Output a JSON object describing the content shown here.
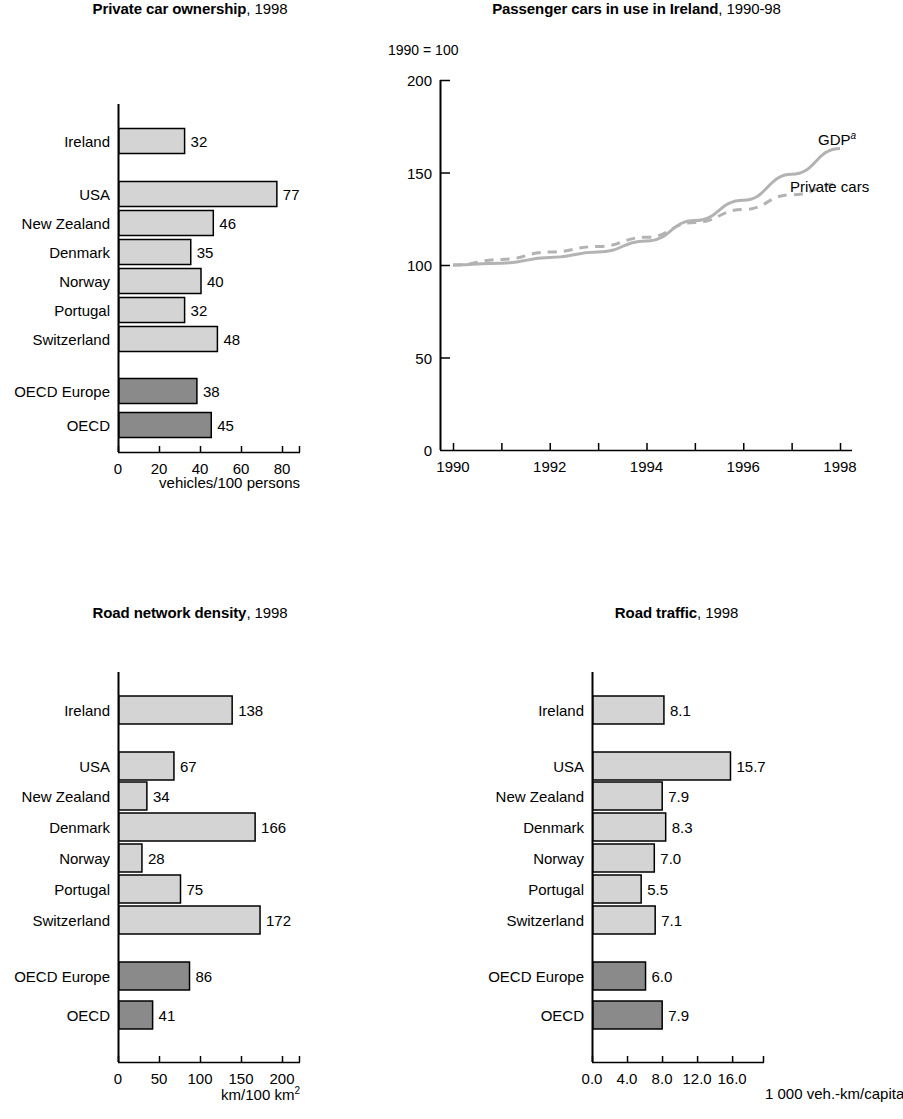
{
  "page": {
    "background": "#ffffff",
    "bar_fill_light": "#d4d4d4",
    "bar_fill_dark": "#8a8a8a",
    "line_color": "#b3b3b3",
    "axis_color": "#000000"
  },
  "charts": [
    {
      "id": "private-car-ownership",
      "title_main": "Private car ownership",
      "title_year": ", 1998",
      "axis_unit": "vehicles/100 persons",
      "categories": [
        "Ireland",
        "USA",
        "New Zealand",
        "Denmark",
        "Norway",
        "Portugal",
        "Switzerland",
        "OECD Europe",
        "OECD"
      ],
      "values": [
        32,
        77,
        46,
        35,
        40,
        32,
        48,
        38,
        45
      ],
      "value_labels": [
        "32",
        "77",
        "46",
        "35",
        "40",
        "32",
        "48",
        "38",
        "45"
      ],
      "highlight": [
        false,
        false,
        false,
        false,
        false,
        false,
        false,
        true,
        true
      ],
      "ticks": [
        0,
        20,
        40,
        60,
        80
      ],
      "tick_labels": [
        "0",
        "20",
        "40",
        "60",
        "80"
      ],
      "xmax": 80
    },
    {
      "id": "road-network-density",
      "title_main": "Road network density",
      "title_year": ", 1998",
      "axis_unit": "km/100 km",
      "axis_unit_sup": "2",
      "categories": [
        "Ireland",
        "USA",
        "New Zealand",
        "Denmark",
        "Norway",
        "Portugal",
        "Switzerland",
        "OECD Europe",
        "OECD"
      ],
      "values": [
        138,
        67,
        34,
        166,
        28,
        75,
        172,
        86,
        41
      ],
      "value_labels": [
        "138",
        "67",
        "34",
        "166",
        "28",
        "75",
        "172",
        "86",
        "41"
      ],
      "highlight": [
        false,
        false,
        false,
        false,
        false,
        false,
        false,
        true,
        true
      ],
      "ticks": [
        0,
        50,
        100,
        150,
        200
      ],
      "tick_labels": [
        "0",
        "50",
        "100",
        "150",
        "200"
      ],
      "xmax": 200
    },
    {
      "id": "road-traffic",
      "title_main": "Road traffic",
      "title_year": ", 1998",
      "axis_unit": "1 000 veh.-km/capita",
      "categories": [
        "Ireland",
        "USA",
        "New Zealand",
        "Denmark",
        "Norway",
        "Portugal",
        "Switzerland",
        "OECD Europe",
        "OECD"
      ],
      "values": [
        8.1,
        15.7,
        7.9,
        8.3,
        7.0,
        5.5,
        7.1,
        6.0,
        7.9
      ],
      "value_labels": [
        "8.1",
        "15.7",
        "7.9",
        "8.3",
        "7.0",
        "5.5",
        "7.1",
        "6.0",
        "7.9"
      ],
      "highlight": [
        false,
        false,
        false,
        false,
        false,
        false,
        false,
        true,
        true
      ],
      "ticks": [
        0,
        4,
        8,
        12,
        16
      ],
      "tick_labels": [
        "0.0",
        "4.0",
        "8.0",
        "12.0",
        "16.0"
      ],
      "xmax": 18.5
    }
  ],
  "line_chart": {
    "id": "passenger-cars-in-use",
    "title_main": "Passenger cars in use in Ireland",
    "title_year": ", 1990-98",
    "index_note": "1990 = 100",
    "ylabels": [
      "200",
      "150",
      "100",
      "50",
      "0"
    ],
    "yvalues": [
      200,
      150,
      100,
      50,
      0
    ],
    "xlabels": [
      "1990",
      "1992",
      "1994",
      "1996",
      "1998"
    ],
    "xticks": [
      1990,
      1991,
      1992,
      1993,
      1994,
      1995,
      1996,
      1997,
      1998
    ],
    "series": [
      {
        "name": "GDP",
        "superscript": "a",
        "style": "solid",
        "x": [
          1990,
          1991,
          1992,
          1993,
          1994,
          1995,
          1996,
          1997,
          1998
        ],
        "values": [
          100,
          101,
          104,
          107,
          113,
          124,
          135,
          149,
          163
        ]
      },
      {
        "name": "Private cars",
        "style": "dashed",
        "x": [
          1990,
          1991,
          1992,
          1993,
          1994,
          1995,
          1996,
          1997,
          1998
        ],
        "values": [
          100,
          103,
          107,
          110,
          115,
          123,
          130,
          138,
          144
        ]
      }
    ]
  },
  "chart_data": [
    {
      "type": "bar",
      "orientation": "horizontal",
      "title": "Private car ownership, 1998",
      "xlabel": "vehicles/100 persons",
      "ylabel": "",
      "categories": [
        "Ireland",
        "USA",
        "New Zealand",
        "Denmark",
        "Norway",
        "Portugal",
        "Switzerland",
        "OECD Europe",
        "OECD"
      ],
      "values": [
        32,
        77,
        46,
        35,
        40,
        32,
        48,
        38,
        45
      ],
      "xlim": [
        0,
        80
      ],
      "xticks": [
        0,
        20,
        40,
        60,
        80
      ],
      "grid": false,
      "legend": "none"
    },
    {
      "type": "line",
      "title": "Passenger cars in use in Ireland, 1990-98",
      "subtitle": "1990 = 100",
      "xlabel": "",
      "ylabel": "",
      "x": [
        1990,
        1991,
        1992,
        1993,
        1994,
        1995,
        1996,
        1997,
        1998
      ],
      "series": [
        {
          "name": "GDP",
          "values": [
            100,
            101,
            104,
            107,
            113,
            124,
            135,
            149,
            163
          ]
        },
        {
          "name": "Private cars",
          "values": [
            100,
            103,
            107,
            110,
            115,
            123,
            130,
            138,
            144
          ]
        }
      ],
      "ylim": [
        0,
        200
      ],
      "yticks": [
        0,
        50,
        100,
        150,
        200
      ],
      "xticks": [
        1990,
        1992,
        1994,
        1996,
        1998
      ],
      "grid": false,
      "legend": "inline-right"
    },
    {
      "type": "bar",
      "orientation": "horizontal",
      "title": "Road network density, 1998",
      "xlabel": "km/100 km2",
      "ylabel": "",
      "categories": [
        "Ireland",
        "USA",
        "New Zealand",
        "Denmark",
        "Norway",
        "Portugal",
        "Switzerland",
        "OECD Europe",
        "OECD"
      ],
      "values": [
        138,
        67,
        34,
        166,
        28,
        75,
        172,
        86,
        41
      ],
      "xlim": [
        0,
        200
      ],
      "xticks": [
        0,
        50,
        100,
        150,
        200
      ],
      "grid": false,
      "legend": "none"
    },
    {
      "type": "bar",
      "orientation": "horizontal",
      "title": "Road traffic, 1998",
      "xlabel": "1 000 veh.-km/capita",
      "ylabel": "",
      "categories": [
        "Ireland",
        "USA",
        "New Zealand",
        "Denmark",
        "Norway",
        "Portugal",
        "Switzerland",
        "OECD Europe",
        "OECD"
      ],
      "values": [
        8.1,
        15.7,
        7.9,
        8.3,
        7.0,
        5.5,
        7.1,
        6.0,
        7.9
      ],
      "xlim": [
        0,
        18.5
      ],
      "xticks": [
        0.0,
        4.0,
        8.0,
        12.0,
        16.0
      ],
      "grid": false,
      "legend": "none"
    }
  ]
}
